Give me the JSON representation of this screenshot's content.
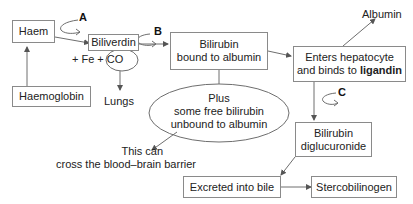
{
  "diagram": {
    "nodes": {
      "haem": "Haem",
      "haemoglobin": "Haemoglobin",
      "biliverdin": "Biliverdin",
      "fe_co": "+ Fe + CO",
      "lungs": "Lungs",
      "bilirubin_albumin_line1": "Bilirubin",
      "bilirubin_albumin_line2": "bound to albumin",
      "free_bilirubin_line1": "Plus",
      "free_bilirubin_line2": "some free bilirubin",
      "free_bilirubin_line3": "unbound to albumin",
      "bbb_line1": "This can",
      "bbb_line2": "cross the blood–brain barrier",
      "albumin": "Albumin",
      "hepatocyte_line1": "Enters hepatocyte",
      "hepatocyte_line2_prefix": "and binds to ",
      "hepatocyte_line2_bold": "ligandin",
      "diglucuronide_line1": "Bilirubin",
      "diglucuronide_line2": "diglucuronide",
      "bile": "Excreted into bile",
      "stercobilinogen": "Stercobilinogen"
    },
    "step_labels": {
      "a": "A",
      "b": "B",
      "c": "C"
    },
    "colors": {
      "line": "#6e6e6e",
      "box_border": "#8a8a8a",
      "text": "#222222"
    }
  }
}
